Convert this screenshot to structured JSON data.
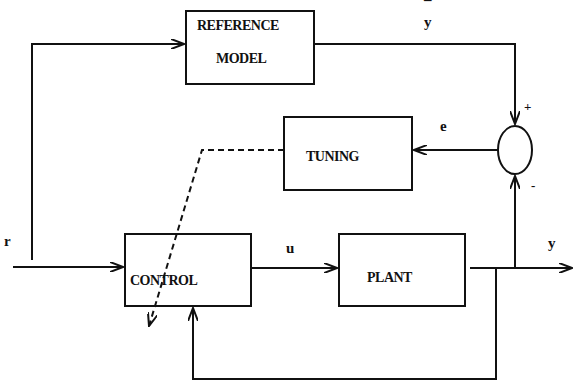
{
  "diagram": {
    "type": "block-diagram",
    "blocks": {
      "reference_model": {
        "line1": "REFERENCE",
        "line2": "MODEL"
      },
      "tuning": {
        "label": "TUNING"
      },
      "control": {
        "label": "CONTROL"
      },
      "plant": {
        "label": "PLANT"
      }
    },
    "signals": {
      "reference": "r",
      "model_output": "y",
      "model_output_bar": "¯",
      "error": "e",
      "control_signal": "u",
      "plant_output": "y"
    },
    "summing_junction": {
      "plus": "+",
      "minus": "-"
    },
    "colors": {
      "line": "#111111",
      "background": "#ffffff"
    }
  }
}
